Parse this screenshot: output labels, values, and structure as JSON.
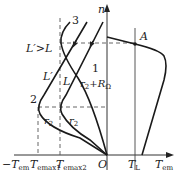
{
  "diagram": {
    "axes": {
      "y_label": "n",
      "x_pos_label": "T",
      "x_pos_sub": "em",
      "x_neg_label": "−T",
      "x_neg_sub": "em",
      "origin_label": "O"
    },
    "ticks": {
      "temax1": {
        "main": "T",
        "sub": "emax1"
      },
      "temax2": {
        "main": "T",
        "sub": "emax2"
      },
      "tl": {
        "main": "T",
        "sub": "L"
      }
    },
    "labels": {
      "ineq": "L′>L",
      "lprime": "L′",
      "l": "L",
      "r2_ro": "r",
      "r2_ro_sub": "2",
      "r2_ro_tail": "+R",
      "r2_ro_tail_sub": "Ω",
      "r2_a": "r",
      "r2_a_sub": "2",
      "r2_b": "r",
      "r2_b_sub": "2",
      "curve1": "1",
      "curve2": "2",
      "curve3": "3",
      "point_a": "A"
    },
    "colors": {
      "line": "#1a1a1a",
      "axis": "#333333",
      "dash": "#555555"
    }
  }
}
